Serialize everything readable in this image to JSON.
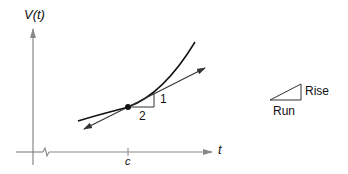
{
  "diagram": {
    "y_axis_label": "V(t)",
    "x_axis_label": "t",
    "x_tick_label": "c",
    "slope_rise_label": "1",
    "slope_run_label": "2",
    "legend": {
      "rise_label": "Rise",
      "run_label": "Run"
    },
    "colors": {
      "axis": "#888888",
      "curve": "#111111",
      "tangent": "#333333"
    }
  }
}
